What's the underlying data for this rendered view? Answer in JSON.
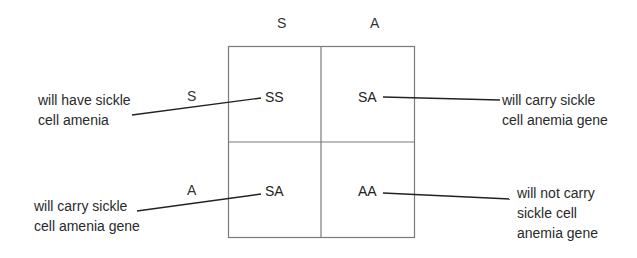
{
  "punnett_square": {
    "column_alleles": [
      "S",
      "A"
    ],
    "row_alleles": [
      "S",
      "A"
    ],
    "cells": [
      {
        "genotype": "SS",
        "annotation": [
          "will have sickle",
          "cell amenia"
        ]
      },
      {
        "genotype": "SA",
        "annotation": [
          "will carry sickle",
          "cell anemia gene"
        ]
      },
      {
        "genotype": "SA",
        "annotation": [
          "will carry sickle",
          "cell amenia gene"
        ]
      },
      {
        "genotype": "AA",
        "annotation": [
          "will not carry",
          "sickle cell",
          "anemia gene"
        ]
      }
    ]
  },
  "colors": {
    "grid_line": "#7a7a7a",
    "leader_line": "#222222",
    "text": "#2a2a2a"
  }
}
